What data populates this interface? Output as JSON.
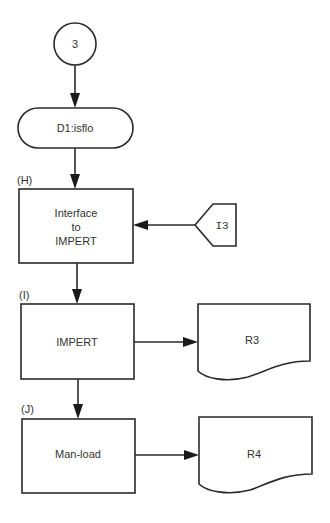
{
  "diagram": {
    "type": "flowchart",
    "start_connector": {
      "label": "3"
    },
    "terminator": {
      "label": "D1:isflo"
    },
    "steps": [
      {
        "id": "H",
        "tag": "(H)",
        "lines": [
          "Interface",
          "to",
          "IMPERT"
        ]
      },
      {
        "id": "I",
        "tag": "(I)",
        "lines": [
          "IMPERT"
        ]
      },
      {
        "id": "J",
        "tag": "(J)",
        "lines": [
          "Man-load"
        ]
      }
    ],
    "input_connector": {
      "label": "I3",
      "target": "H"
    },
    "documents": [
      {
        "label": "R3",
        "source": "I"
      },
      {
        "label": "R4",
        "source": "J"
      }
    ],
    "colors": {
      "stroke": "#2a2a2a",
      "text": "#333333",
      "background": "#ffffff"
    }
  }
}
